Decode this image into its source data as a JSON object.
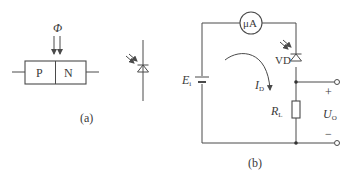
{
  "figure_a": {
    "caption": "(a)",
    "flux_symbol": "Φ",
    "p_region_label": "P",
    "n_region_label": "N",
    "icons": [
      "pn-junction-block",
      "light-arrows",
      "photodiode-symbol"
    ]
  },
  "figure_b": {
    "caption": "(b)",
    "ammeter_label": "μA",
    "diode_label": "VD",
    "source_label": "E",
    "source_subscript": "i",
    "current_label": "I",
    "current_subscript": "D",
    "resistor_label": "R",
    "resistor_subscript": "L",
    "output_label": "U",
    "output_subscript": "O",
    "plus_sign": "+",
    "minus_sign": "−",
    "icons": [
      "microammeter",
      "photodiode-symbol",
      "battery",
      "current-arrow",
      "resistor",
      "output-terminals"
    ]
  },
  "colors": {
    "line": "#4a4a4a",
    "text": "#3a3a3a",
    "background": "#ffffff"
  }
}
